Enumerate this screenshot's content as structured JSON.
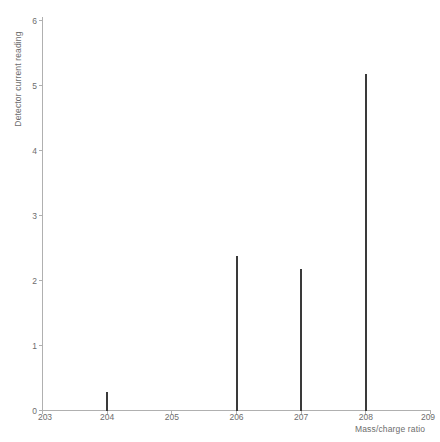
{
  "chart_data": {
    "type": "bar",
    "title": "",
    "subtitle": "",
    "xlabel": "Mass/charge ratio",
    "ylabel": "Detector current reading",
    "x": [
      203,
      204,
      205,
      206,
      207,
      208,
      209
    ],
    "values": [
      0,
      0.28,
      0,
      2.38,
      2.17,
      5.18,
      0
    ],
    "categories": [
      "203",
      "204",
      "205",
      "206",
      "207",
      "208",
      "209"
    ],
    "peaks": [
      {
        "mz": 204,
        "intensity": 0.28
      },
      {
        "mz": 206,
        "intensity": 2.38
      },
      {
        "mz": 207,
        "intensity": 2.17
      },
      {
        "mz": 208,
        "intensity": 5.18
      }
    ],
    "xlim": [
      203,
      209
    ],
    "ylim": [
      0,
      6
    ],
    "xticks": [
      "203",
      "204",
      "205",
      "206",
      "207",
      "208",
      "209"
    ],
    "yticks": [
      "0",
      "1",
      "2",
      "3",
      "4",
      "5",
      "6"
    ],
    "grid": false,
    "legend": null,
    "annotations": [],
    "colors": {
      "peak": "#3a3a3a",
      "axis": "#b0b0b0",
      "text": "#6d6d6d",
      "background": "#ffffff"
    }
  }
}
